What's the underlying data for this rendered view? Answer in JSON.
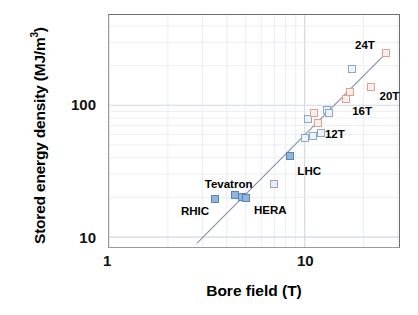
{
  "chart_data": {
    "type": "scatter",
    "title": "",
    "xlabel": "Bore field (T)",
    "ylabel_text": "Stored energy density (MJ/m",
    "ylabel_sup": "3",
    "ylabel_tail": ")",
    "ylabel_full": "Stored energy density (MJ/m3)",
    "xscale": "log",
    "yscale": "log",
    "xlim": [
      1,
      30
    ],
    "ylim": [
      8,
      320
    ],
    "xticks": [
      "1",
      "10"
    ],
    "xtick_values": [
      1,
      10
    ],
    "yticks": [
      "100",
      "10"
    ],
    "ytick_values": [
      100,
      10
    ],
    "grid": "minor log gridlines on both axes, light grey",
    "legend": "none",
    "series": [
      {
        "name": "Existing accelerator magnets",
        "marker": "filled blue square",
        "color": "#8fb4de",
        "points": [
          {
            "x": 3.45,
            "y": 20.0,
            "label": "RHIC"
          },
          {
            "x": 4.35,
            "y": 21.5,
            "label": "Tevatron"
          },
          {
            "x": 4.75,
            "y": 20.6,
            "label": "HERA"
          },
          {
            "x": 4.95,
            "y": 20.2,
            "label": ""
          },
          {
            "x": 8.33,
            "y": 42.0,
            "label": "LHC"
          }
        ]
      },
      {
        "name": "Design / future high-field magnets (open markers)",
        "marker": "open square",
        "color": "#e0a08c",
        "points": [
          {
            "x": 6.9,
            "y": 26.0,
            "label": "",
            "style": "grey"
          },
          {
            "x": 9.9,
            "y": 57.0,
            "label": "",
            "style": "open-blue"
          },
          {
            "x": 10.2,
            "y": 80.0,
            "label": "",
            "style": "open-blue"
          },
          {
            "x": 10.9,
            "y": 60.0,
            "label": "",
            "style": "open-blue"
          },
          {
            "x": 11.0,
            "y": 88.0,
            "label": "",
            "style": "open-red"
          },
          {
            "x": 11.5,
            "y": 75.0,
            "label": "12T",
            "style": "open-red"
          },
          {
            "x": 11.9,
            "y": 63.0,
            "label": "",
            "style": "open-blue"
          },
          {
            "x": 12.8,
            "y": 94.0,
            "label": "",
            "style": "open-blue"
          },
          {
            "x": 13.1,
            "y": 88.0,
            "label": "",
            "style": "open-blue"
          },
          {
            "x": 16.0,
            "y": 112.0,
            "label": "16T",
            "style": "open-red"
          },
          {
            "x": 16.8,
            "y": 128.0,
            "label": "",
            "style": "open-red"
          },
          {
            "x": 17.2,
            "y": 190.0,
            "label": "",
            "style": "open-blue"
          },
          {
            "x": 21.5,
            "y": 140.0,
            "label": "20T",
            "style": "open-red"
          },
          {
            "x": 25.5,
            "y": 250.0,
            "label": "24T",
            "style": "open-red"
          }
        ]
      }
    ],
    "trendline": {
      "description": "straight fit line on log-log axes",
      "x_start": 2.8,
      "y_start": 9.3,
      "x_end": 25.5,
      "y_end": 250.0,
      "color": "#8a8ab0"
    },
    "annotations": [
      {
        "text": "RHIC",
        "x": 3.45,
        "y": 20.0,
        "pos": "below-left"
      },
      {
        "text": "Tevatron",
        "x": 4.35,
        "y": 21.5,
        "pos": "above-left"
      },
      {
        "text": "HERA",
        "x": 4.9,
        "y": 20.4,
        "pos": "below-right"
      },
      {
        "text": "LHC",
        "x": 8.33,
        "y": 42.0,
        "pos": "below-right"
      },
      {
        "text": "12T",
        "x": 11.5,
        "y": 75.0,
        "pos": "right"
      },
      {
        "text": "16T",
        "x": 16.0,
        "y": 112.0,
        "pos": "below-right"
      },
      {
        "text": "20T",
        "x": 21.5,
        "y": 140.0,
        "pos": "below-right"
      },
      {
        "text": "24T",
        "x": 25.5,
        "y": 250.0,
        "pos": "above-left"
      }
    ]
  },
  "axis": {
    "x_title": "Bore field (T)",
    "y_title_main": "Stored energy density (MJ/m",
    "y_title_sup": "3",
    "y_title_end": ")",
    "xtick_1": "1",
    "xtick_10": "10",
    "ytick_100": "100",
    "ytick_10": "10"
  },
  "labels": {
    "rhic": "RHIC",
    "tevatron": "Tevatron",
    "hera": "HERA",
    "lhc": "LHC",
    "t12": "12T",
    "t16": "16T",
    "t20": "20T",
    "t24": "24T"
  },
  "colors": {
    "marker_blue_fill": "#8fb4de",
    "marker_blue_edge": "#5b83b5",
    "marker_open_red_edge": "#e0a08c",
    "marker_open_blue_edge": "#8aa8cc",
    "trendline": "#8a8ab0",
    "grid": "#e3e6ee",
    "frame": "#6f6f6f"
  }
}
